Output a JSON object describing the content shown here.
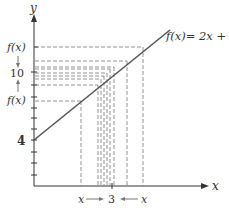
{
  "diagram": {
    "function_label": "f(x)= 2x + 4",
    "y_axis_label": "y",
    "x_axis_label": "x",
    "y_intercept_label": "4",
    "limit_value_label": "10",
    "x_limit_label": "3",
    "fx_upper_label": "f(x)",
    "fx_lower_label": "f(x)",
    "x_left_label": "x",
    "x_right_label": "x",
    "colors": {
      "line": "#555555",
      "axes": "#333333",
      "dashes": "#777777"
    }
  }
}
